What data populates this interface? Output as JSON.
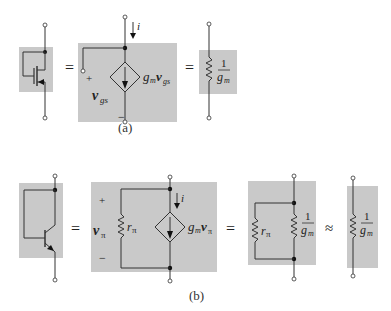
{
  "colors": {
    "box_fill": "#c9c9c9",
    "wire": "#333333",
    "node": "#111111",
    "background": "#ffffff"
  },
  "part_a": {
    "caption": "(a)",
    "equals": [
      "=",
      "="
    ],
    "current_label": "i",
    "control_voltage": "v",
    "control_voltage_sub": "gs",
    "plus": "+",
    "minus": "−",
    "source_label_g": "g",
    "source_label_m": "m",
    "source_label_v": "v",
    "source_label_sub": "gs",
    "resistor_num": "1",
    "resistor_den_g": "g",
    "resistor_den_m": "m"
  },
  "part_b": {
    "caption": "(b)",
    "equals": [
      "=",
      "="
    ],
    "approx": "≈",
    "current_label": "i",
    "plus": "+",
    "minus": "−",
    "control_voltage": "v",
    "control_voltage_sub": "π",
    "r_pi": "r",
    "r_pi_sub": "π",
    "source_label_g": "g",
    "source_label_m": "m",
    "source_label_v": "v",
    "source_label_sub": "π",
    "resistor_num": "1",
    "resistor_den_g": "g",
    "resistor_den_m": "m"
  }
}
